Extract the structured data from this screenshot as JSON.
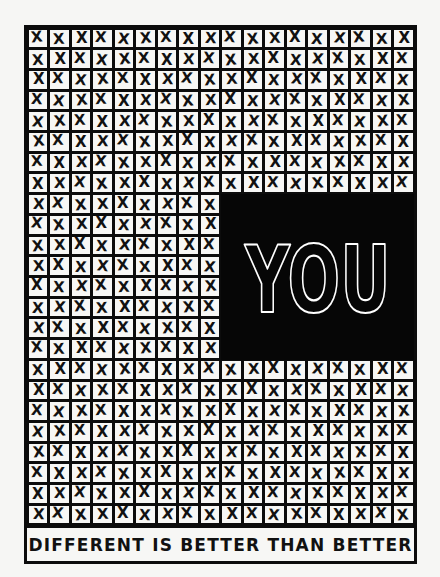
{
  "artwork": {
    "headline": "YOU",
    "caption": "DIFFERENT IS BETTER THAN BETTER",
    "cell_mark": "X",
    "grid": {
      "columns": 18,
      "rows": 24,
      "highlight_block": {
        "first_column": 9,
        "last_column": 17,
        "first_row": 8,
        "last_row": 15
      }
    },
    "colors": {
      "ink": "#0c0c0c",
      "paper": "#f7f7f5",
      "background": "#f6f6f4",
      "headline_outline": "#ffffff"
    }
  }
}
